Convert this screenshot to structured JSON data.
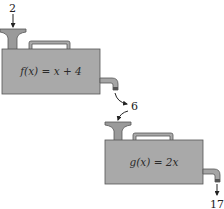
{
  "diagram": {
    "type": "function-machine-composition",
    "input_value": "2",
    "intermediate_value": "6",
    "output_value": "17",
    "machines": [
      {
        "id": "f",
        "formula": "f(x) = x + 4"
      },
      {
        "id": "g",
        "formula": "g(x) = 2x"
      }
    ],
    "colors": {
      "machine_fill": "#a9a9a9",
      "machine_stroke": "#555555",
      "funnel_fill": "#9a9a9a",
      "spout_fill": "#a5a5a5",
      "arrow": "#222222",
      "background": "#ffffff"
    }
  }
}
